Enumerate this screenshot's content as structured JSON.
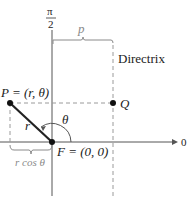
{
  "diagram": {
    "type": "polar-conic-directrix",
    "axis_labels": {
      "vertical_top_num": "π",
      "vertical_top_den": "2",
      "horizontal_right": "0"
    },
    "labels": {
      "p_distance": "p",
      "directrix": "Directrix",
      "point_P": "P = (r, θ)",
      "point_Q": "Q",
      "radius": "r",
      "angle": "θ",
      "focus": "F = (0, 0)",
      "r_cos_theta": "r cos θ"
    },
    "colors": {
      "line": "#222222",
      "dashed": "#9a9a9a",
      "brace": "#8a8a8a",
      "axis": "#555555"
    }
  }
}
